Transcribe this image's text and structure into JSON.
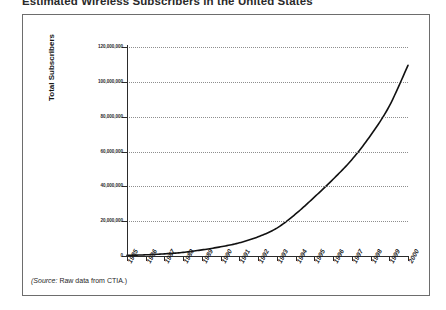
{
  "figure": {
    "title": "Estimated Wireless Subscribers in the United States",
    "source_prefix": "(Source:",
    "source_text": "Raw data from CTIA.)",
    "source_full": "(Source:  Raw data from CTIA.)"
  },
  "chart_data": {
    "type": "line",
    "title": "Estimated Wireless Subscribers in the United States",
    "xlabel": "",
    "ylabel": "Total Subscribers",
    "categories": [
      "1985",
      "1986",
      "1987",
      "1988",
      "1989",
      "1990",
      "1991",
      "1992",
      "1993",
      "1994",
      "1995",
      "1996",
      "1997",
      "1998",
      "1999",
      "2000"
    ],
    "x": [
      1985,
      1986,
      1987,
      1988,
      1989,
      1990,
      1991,
      1992,
      1993,
      1994,
      1995,
      1996,
      1997,
      1998,
      1999,
      2000
    ],
    "values": [
      340000,
      682000,
      1231000,
      2069000,
      3509000,
      5283000,
      7557000,
      11033000,
      16009000,
      24134000,
      33786000,
      44043000,
      55312000,
      69209000,
      86047000,
      109478000
    ],
    "series": [
      {
        "name": "Total Subscribers",
        "values": [
          340000,
          682000,
          1231000,
          2069000,
          3509000,
          5283000,
          7557000,
          11033000,
          16009000,
          24134000,
          33786000,
          44043000,
          55312000,
          69209000,
          86047000,
          109478000
        ]
      }
    ],
    "ylim": [
      0,
      120000000
    ],
    "xlim": [
      1985,
      2000
    ],
    "y_ticks": [
      0,
      20000000,
      40000000,
      60000000,
      80000000,
      100000000,
      120000000
    ],
    "y_tick_labels": [
      "0",
      "20,000,000",
      "40,000,000",
      "60,000,000",
      "80,000,000",
      "100,000,000",
      "120,000,000"
    ],
    "grid": true,
    "grid_style": "dotted-horizontal",
    "legend": false,
    "line_color": "#111111",
    "line_width": 1.6
  }
}
